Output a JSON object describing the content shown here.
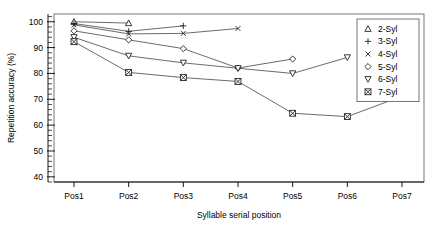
{
  "chart_data": {
    "type": "line",
    "title": "",
    "xlabel": "Syllable serial position",
    "ylabel": "Repetition accuracy (%)",
    "categories": [
      "Pos1",
      "Pos2",
      "Pos3",
      "Pos4",
      "Pos5",
      "Pos6",
      "Pos7"
    ],
    "xtick_labels": [
      "Pos1",
      "Pos2",
      "Pos3",
      "Pos4",
      "Pos5",
      "Pos6",
      "Pos7"
    ],
    "ytick_labels": [
      "40",
      "50",
      "60",
      "70",
      "80",
      "90",
      "100"
    ],
    "yticks": [
      40,
      50,
      60,
      70,
      80,
      90,
      100
    ],
    "ylim": [
      38,
      103
    ],
    "y_minor_step": 2,
    "grid": false,
    "legend_position": "top-right",
    "series": [
      {
        "name": "2-Syl",
        "marker": "triangle-up",
        "x": [
          "Pos1",
          "Pos2"
        ],
        "values": [
          100.0,
          99.5
        ]
      },
      {
        "name": "3-Syl",
        "marker": "plus",
        "x": [
          "Pos1",
          "Pos2",
          "Pos3"
        ],
        "values": [
          99.3,
          96.3,
          98.4
        ]
      },
      {
        "name": "4-Syl",
        "marker": "cross",
        "x": [
          "Pos1",
          "Pos2",
          "Pos3",
          "Pos4"
        ],
        "values": [
          98.8,
          95.3,
          95.5,
          97.4
        ]
      },
      {
        "name": "5-Syl",
        "marker": "diamond",
        "x": [
          "Pos1",
          "Pos2",
          "Pos3",
          "Pos4",
          "Pos5"
        ],
        "values": [
          96.5,
          93.0,
          89.6,
          82.1,
          85.6
        ]
      },
      {
        "name": "6-Syl",
        "marker": "triangle-down",
        "x": [
          "Pos1",
          "Pos2",
          "Pos3",
          "Pos4",
          "Pos5",
          "Pos6"
        ],
        "values": [
          94.0,
          86.8,
          84.1,
          82.0,
          80.0,
          86.2
        ]
      },
      {
        "name": "7-Syl",
        "marker": "crossed-square",
        "x": [
          "Pos1",
          "Pos2",
          "Pos3",
          "Pos4",
          "Pos5",
          "Pos6",
          "Pos7"
        ],
        "values": [
          92.3,
          80.4,
          78.4,
          76.9,
          64.6,
          63.3,
          71.2
        ]
      }
    ],
    "legend_entries": [
      {
        "label": "2-Syl",
        "marker": "triangle-up"
      },
      {
        "label": "3-Syl",
        "marker": "plus"
      },
      {
        "label": "4-Syl",
        "marker": "cross"
      },
      {
        "label": "5-Syl",
        "marker": "diamond"
      },
      {
        "label": "6-Syl",
        "marker": "triangle-down"
      },
      {
        "label": "7-Syl",
        "marker": "crossed-square"
      }
    ],
    "colors": {
      "line": "#3a3a3a",
      "marker_stroke": "#1a1a1a",
      "marker_fill": "#ffffff",
      "axis": "#000000",
      "frame": "#555555",
      "background": "#ffffff"
    }
  }
}
